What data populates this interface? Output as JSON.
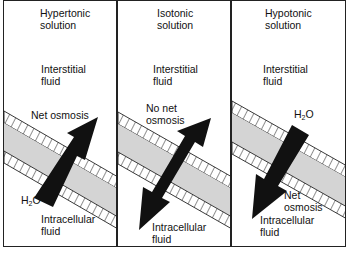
{
  "panels": [
    {
      "id": "hypertonic",
      "title_line1": "Hypertonic",
      "title_line2": "solution",
      "outside_line1": "Interstitial",
      "outside_line2": "fluid",
      "arrow_label": "Net osmosis",
      "water_main": "H",
      "water_sub": "2",
      "water_end": "O",
      "inside_line1": "Intracellular",
      "inside_line2": "fluid",
      "arrow_direction": "outward"
    },
    {
      "id": "isotonic",
      "title_line1": "Isotonic",
      "title_line2": "solution",
      "outside_line1": "Interstitial",
      "outside_line2": "fluid",
      "arrow_label_line1": "No net",
      "arrow_label_line2": "osmosis",
      "inside_line1": "Intracellular",
      "inside_line2": "fluid",
      "arrow_direction": "bidirectional"
    },
    {
      "id": "hypotonic",
      "title_line1": "Hypotonic",
      "title_line2": "solution",
      "outside_line1": "Interstitial",
      "outside_line2": "fluid",
      "water_main": "H",
      "water_sub": "2",
      "water_end": "O",
      "arrow_label_line1": "Net",
      "arrow_label_line2": "osmosis",
      "inside_line1": "Intracellular",
      "inside_line2": "fluid",
      "arrow_direction": "inward"
    }
  ],
  "colors": {
    "membrane_fill": "#d4d4d4",
    "arrow": "#111111",
    "border": "#222222"
  }
}
